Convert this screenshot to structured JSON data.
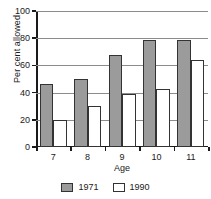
{
  "chart_data": {
    "type": "bar",
    "title": "",
    "xlabel": "Age",
    "ylabel": "Per cent allowed",
    "categories": [
      "7",
      "8",
      "9",
      "10",
      "11"
    ],
    "series": [
      {
        "name": "1971",
        "color": "#9b9b9b",
        "values": [
          46,
          50,
          68,
          79,
          79
        ]
      },
      {
        "name": "1990",
        "color": "#ffffff",
        "values": [
          20,
          30,
          39,
          43,
          64
        ]
      }
    ],
    "ylim": [
      0,
      100
    ],
    "yticks": [
      0,
      20,
      40,
      60,
      80,
      100
    ],
    "ytick_labels": [
      "0",
      "20",
      "40",
      "60",
      "80",
      "100"
    ],
    "grid": true,
    "grid_axis": "y",
    "legend_position": "bottom"
  },
  "legend": {
    "items": [
      {
        "label": "1971"
      },
      {
        "label": "1990"
      }
    ]
  }
}
